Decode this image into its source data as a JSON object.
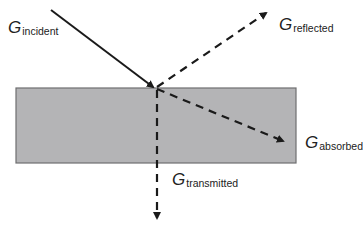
{
  "diagram": {
    "type": "radiation-interaction",
    "colors": {
      "slab_fill": "#b4b4b6",
      "slab_border": "#6e6e70",
      "arrow": "#1a1a1a",
      "text": "#222222"
    },
    "labels": {
      "incident": {
        "symbol": "G",
        "subscript": "incident"
      },
      "reflected": {
        "symbol": "G",
        "subscript": "reflected"
      },
      "absorbed": {
        "symbol": "G",
        "subscript": "absorbed"
      },
      "transmitted": {
        "symbol": "G",
        "subscript": "transmitted"
      }
    },
    "arrows": [
      {
        "name": "incident",
        "style": "solid",
        "from": [
          51,
          10
        ],
        "to": [
          155,
          88
        ]
      },
      {
        "name": "reflected",
        "style": "dashed",
        "from": [
          155,
          88
        ],
        "to": [
          268,
          11
        ]
      },
      {
        "name": "absorbed",
        "style": "dashed",
        "from": [
          155,
          88
        ],
        "to": [
          285,
          142
        ]
      },
      {
        "name": "transmitted",
        "style": "dashed",
        "from": [
          155,
          88
        ],
        "to": [
          157,
          220
        ]
      }
    ]
  }
}
